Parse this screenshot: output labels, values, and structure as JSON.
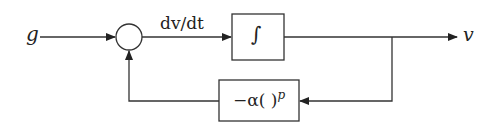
{
  "diagram": {
    "type": "block-diagram",
    "input_label": "g",
    "output_label": "v",
    "summing_junction": {
      "shape": "circle"
    },
    "edge_labels": {
      "derivative": "dv/dt"
    },
    "blocks": {
      "integrator": {
        "label": "∫"
      },
      "feedback": {
        "label_prefix": "−α( )",
        "label_exponent": "p"
      }
    },
    "colors": {
      "line": "#333333",
      "background": "#ffffff"
    }
  }
}
